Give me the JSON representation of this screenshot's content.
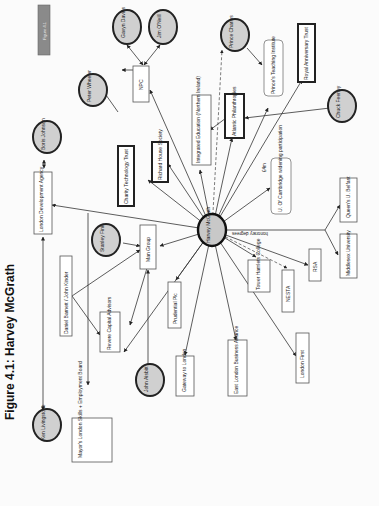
{
  "figure": {
    "title": "Figure 4.1: Harvey McGrath",
    "tag": "Figure 4.1",
    "orientation": "rotated -90deg (landscape page scanned portrait)"
  },
  "center_node": {
    "label": "Harvey McGrath",
    "shape": "circle"
  },
  "people": [
    {
      "id": "gavyn",
      "label": "Gavyn Davies"
    },
    {
      "id": "jim",
      "label": "Jim O'Neill"
    },
    {
      "id": "peter",
      "label": "Peter Wheeler"
    },
    {
      "id": "boris",
      "label": "Boris Johnson"
    },
    {
      "id": "charles",
      "label": "Prince Charles"
    },
    {
      "id": "chuck",
      "label": "Chuck Feeney"
    },
    {
      "id": "stanley",
      "label": "Stanley Fink"
    },
    {
      "id": "john",
      "label": "John Aisbitt"
    },
    {
      "id": "ken",
      "label": "Ken Livingstone"
    }
  ],
  "organisations": [
    {
      "id": "npc",
      "label": "NPC"
    },
    {
      "id": "integrated",
      "label": "Integrated Education (Northern Ireland)"
    },
    {
      "id": "atlantic",
      "label": "Atlantic Philanthropies"
    },
    {
      "id": "princes",
      "label": "Prince's Teaching Institute"
    },
    {
      "id": "royal",
      "label": "Royal Anniversary Trust"
    },
    {
      "id": "charity",
      "label": "Charity Technology Trust"
    },
    {
      "id": "richard",
      "label": "Richard House Society"
    },
    {
      "id": "lda",
      "label": "London Development Agency"
    },
    {
      "id": "cambridge",
      "label": "U. Of Cambridge widening participation"
    },
    {
      "id": "queens",
      "label": "Queen's U. Belfast"
    },
    {
      "id": "middlesex",
      "label": "Middlesex University"
    },
    {
      "id": "man",
      "label": "Man Group"
    },
    {
      "id": "daniel",
      "label": "Daniel Barnett / John Kinder"
    },
    {
      "id": "prudential",
      "label": "Prudential Plc"
    },
    {
      "id": "tower",
      "label": "Tower Hamlets College"
    },
    {
      "id": "nesta",
      "label": "NESTA"
    },
    {
      "id": "rsa",
      "label": "RSA"
    },
    {
      "id": "revere",
      "label": "Revere Capital Advisors"
    },
    {
      "id": "gateway",
      "label": "Gateway to London"
    },
    {
      "id": "elba",
      "label": "East London Business Alliance"
    },
    {
      "id": "londonfirst",
      "label": "London First"
    },
    {
      "id": "mayors",
      "label": "Mayor's London Skills + Employment Board"
    }
  ],
  "edge_labels": {
    "cambridge": "£4m",
    "honorary": "honorary degrees"
  }
}
